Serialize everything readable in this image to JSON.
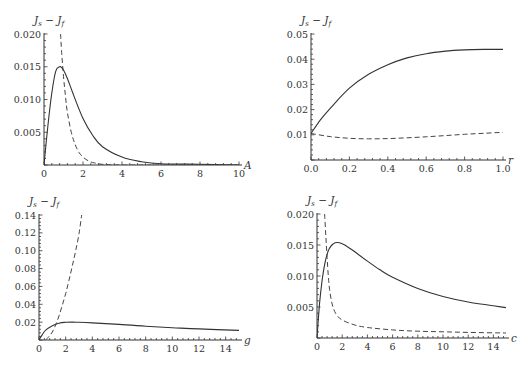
{
  "chart_data": [
    {
      "type": "line",
      "panel": "top-left",
      "title": "",
      "xlabel": "A",
      "ylabel": "J_s - J_f",
      "xlim": [
        0,
        10
      ],
      "ylim": [
        0,
        0.02
      ],
      "xticks": [
        "0",
        "2",
        "4",
        "6",
        "8",
        "10"
      ],
      "yticks": [
        "0.005",
        "0.010",
        "0.015",
        "0.020"
      ],
      "series": [
        {
          "name": "solid",
          "style": "solid",
          "x": [
            0,
            0.2,
            0.4,
            0.6,
            0.8,
            0.9,
            1.0,
            1.2,
            1.5,
            2,
            2.5,
            3,
            4,
            5,
            6,
            8,
            10
          ],
          "y": [
            0,
            0.006,
            0.011,
            0.0143,
            0.015,
            0.0149,
            0.0145,
            0.0132,
            0.0108,
            0.0071,
            0.0045,
            0.0028,
            0.0012,
            0.0005,
            0.0002,
            0.0001,
            0.0
          ]
        },
        {
          "name": "dashed",
          "style": "dashed",
          "x": [
            0.85,
            0.9,
            1.0,
            1.1,
            1.2,
            1.4,
            1.6,
            1.8,
            2.0,
            2.3,
            2.6,
            3.0,
            4,
            6,
            10
          ],
          "y": [
            0.02,
            0.0175,
            0.0135,
            0.0105,
            0.008,
            0.005,
            0.0031,
            0.0019,
            0.0012,
            0.0006,
            0.0003,
            0.0001,
            0.0,
            0.0,
            0.0
          ]
        }
      ]
    },
    {
      "type": "line",
      "panel": "top-right",
      "title": "",
      "xlabel": "r",
      "ylabel": "J_s - J_f",
      "xlim": [
        0,
        1.0
      ],
      "ylim": [
        0,
        0.05
      ],
      "xticks": [
        "0.0",
        "0.2",
        "0.4",
        "0.6",
        "0.8",
        "1.0"
      ],
      "yticks": [
        "0.01",
        "0.02",
        "0.03",
        "0.04",
        "0.05"
      ],
      "series": [
        {
          "name": "solid",
          "style": "solid",
          "x": [
            0,
            0.05,
            0.1,
            0.2,
            0.3,
            0.4,
            0.5,
            0.6,
            0.7,
            0.8,
            0.9,
            1.0
          ],
          "y": [
            0.0105,
            0.016,
            0.0205,
            0.0285,
            0.034,
            0.0378,
            0.0405,
            0.0422,
            0.0432,
            0.0437,
            0.0439,
            0.0439
          ]
        },
        {
          "name": "dashed",
          "style": "dashed",
          "x": [
            0,
            0.1,
            0.2,
            0.3,
            0.4,
            0.5,
            0.6,
            0.7,
            0.8,
            0.9,
            1.0
          ],
          "y": [
            0.0105,
            0.0093,
            0.0086,
            0.0084,
            0.0085,
            0.0088,
            0.0092,
            0.0097,
            0.0102,
            0.0106,
            0.011
          ]
        }
      ]
    },
    {
      "type": "line",
      "panel": "bottom-left",
      "title": "",
      "xlabel": "g",
      "ylabel": "J_s - J_f",
      "xlim": [
        0,
        15
      ],
      "ylim": [
        0,
        0.14
      ],
      "xticks": [
        "0",
        "2",
        "4",
        "6",
        "8",
        "10",
        "12",
        "14"
      ],
      "yticks": [
        "0.02",
        "0.04",
        "0.06",
        "0.08",
        "0.10",
        "0.12",
        "0.14"
      ],
      "series": [
        {
          "name": "solid",
          "style": "solid",
          "x": [
            0,
            0.25,
            0.5,
            1,
            1.5,
            2,
            2.5,
            3,
            4,
            6,
            8,
            10,
            12,
            15
          ],
          "y": [
            0,
            0.006,
            0.011,
            0.016,
            0.0188,
            0.0198,
            0.02,
            0.0198,
            0.0192,
            0.0175,
            0.0155,
            0.0138,
            0.0124,
            0.0108
          ]
        },
        {
          "name": "dashed",
          "style": "dashed",
          "x": [
            0.5,
            0.75,
            1.0,
            1.25,
            1.5,
            1.75,
            2.0,
            2.25,
            2.5,
            2.75,
            3.0,
            3.2
          ],
          "y": [
            0,
            0.004,
            0.009,
            0.017,
            0.027,
            0.039,
            0.052,
            0.067,
            0.083,
            0.1,
            0.119,
            0.14
          ]
        }
      ]
    },
    {
      "type": "line",
      "panel": "bottom-right",
      "title": "",
      "xlabel": "c",
      "ylabel": "J_s - J_f",
      "xlim": [
        0,
        15
      ],
      "ylim": [
        0,
        0.02
      ],
      "xticks": [
        "0",
        "2",
        "4",
        "6",
        "8",
        "10",
        "12",
        "14"
      ],
      "yticks": [
        "0.005",
        "0.010",
        "0.015",
        "0.020"
      ],
      "series": [
        {
          "name": "solid",
          "style": "solid",
          "x": [
            0,
            0.2,
            0.4,
            0.6,
            0.8,
            1.0,
            1.3,
            1.6,
            2.0,
            2.5,
            3,
            4,
            5,
            6,
            8,
            10,
            12,
            15
          ],
          "y": [
            0,
            0.0055,
            0.0092,
            0.0118,
            0.0135,
            0.0145,
            0.0152,
            0.0154,
            0.0152,
            0.0146,
            0.0139,
            0.0124,
            0.011,
            0.0098,
            0.008,
            0.0067,
            0.0058,
            0.0049
          ]
        },
        {
          "name": "dashed",
          "style": "dashed",
          "x": [
            0.6,
            0.7,
            0.8,
            0.9,
            1.0,
            1.2,
            1.5,
            2,
            3,
            4,
            6,
            8,
            10,
            12,
            15
          ],
          "y": [
            0.02,
            0.0165,
            0.013,
            0.01,
            0.0078,
            0.0055,
            0.0039,
            0.0029,
            0.0021,
            0.0017,
            0.0013,
            0.0011,
            0.001,
            0.0009,
            0.0008
          ]
        }
      ]
    }
  ]
}
